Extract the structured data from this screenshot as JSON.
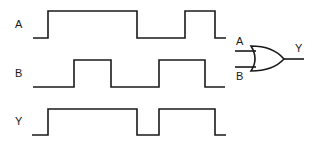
{
  "colors": {
    "stroke": "#1a1a1a",
    "background": "#ffffff"
  },
  "signals": [
    {
      "name": "A",
      "label": "A",
      "points": "33,38 48,38 48,11 137,11 137,38 185,38 185,11 215,11 215,38 226,38"
    },
    {
      "name": "B",
      "label": "B",
      "points": "33,87 74,87 74,60 111,60 111,87 159,87 159,60 205,60 205,87 225,87"
    },
    {
      "name": "Y",
      "label": "Y",
      "points": "32,135 48,135 48,109 137,109 137,135 159,135 159,109 215,109 215,135 226,135"
    }
  ],
  "gate": {
    "type": "OR",
    "input_a_label": "A",
    "input_b_label": "B",
    "output_label": "Y"
  }
}
